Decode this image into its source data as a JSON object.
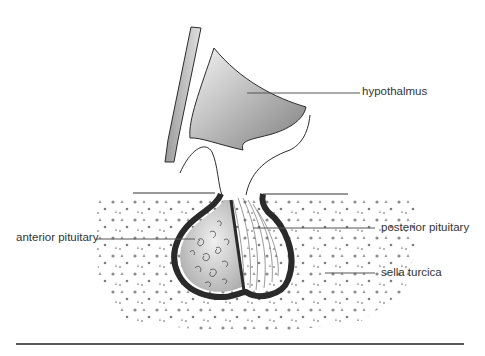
{
  "diagram": {
    "labels": {
      "hypothalmus": "hypothalmus",
      "anterior_pituitary": "anterior pituitary",
      "posterior_pituitary": "posterior pituitary",
      "sella_turcica": "sella turcica"
    },
    "colors": {
      "line": "#2b2b2b",
      "leader": "#555555",
      "capsule": "#2a2a2a",
      "hypothalamus_fill_light": "#f2f2f2",
      "hypothalamus_fill_dark": "#8a8a8a",
      "anterior_fill": "#bdbdbd",
      "dots": "#7a7a7a"
    }
  }
}
